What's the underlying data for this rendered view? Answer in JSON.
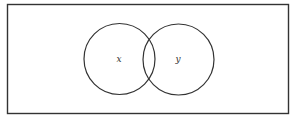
{
  "diagram": {
    "type": "venn",
    "universe": {
      "x": 7,
      "y": 4,
      "width": 282,
      "height": 110
    },
    "sets": [
      {
        "label": "x",
        "cx": 119.5,
        "cy": 59,
        "r": 35.5
      },
      {
        "label": "y",
        "cx": 178.5,
        "cy": 59.5,
        "r": 35.5
      }
    ],
    "stroke_color": "#333333",
    "background": "#ffffff"
  }
}
